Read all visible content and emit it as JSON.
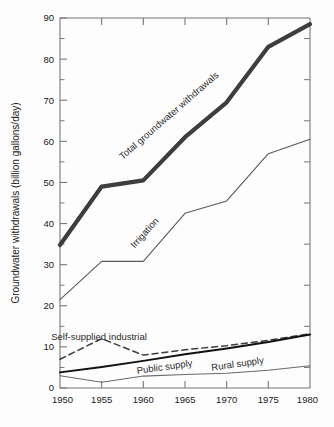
{
  "chart_data": {
    "type": "line",
    "title": "",
    "xlabel": "",
    "ylabel": "Groundwater withdrawals (billion gallons/day)",
    "x": [
      1950,
      1955,
      1960,
      1965,
      1970,
      1975,
      1980
    ],
    "xlim": [
      1950,
      1980
    ],
    "ylim": [
      0,
      90
    ],
    "xticks": [
      "1950",
      "1955",
      "1960",
      "1965",
      "1970",
      "1975",
      "1980"
    ],
    "yticks": [
      "0",
      "10",
      "20",
      "30",
      "40",
      "50",
      "60",
      "70",
      "80",
      "90"
    ],
    "ytick_minor_step": 5,
    "grid": false,
    "legend_position": "inline-labels",
    "series": [
      {
        "name": "Total groundwater withdrawals",
        "style": "thick-solid",
        "color": "#3d3d3d",
        "width": 4.2,
        "label_angle": -41,
        "label_x": 171,
        "label_y": 118,
        "values": [
          34.8,
          49.0,
          50.5,
          61.0,
          69.5,
          83.0,
          88.5
        ]
      },
      {
        "name": "Irrigation",
        "style": "thin-solid",
        "color": "#5a5a5a",
        "width": 1.1,
        "label_angle": -48,
        "label_x": 147,
        "label_y": 235,
        "values": [
          21.5,
          30.8,
          30.8,
          42.5,
          45.5,
          57.0,
          60.5
        ]
      },
      {
        "name": "Self-supplied industrial",
        "style": "dashed",
        "color": "#3d3d3d",
        "width": 1.5,
        "label_angle": 0,
        "label_x": 99,
        "label_y": 340,
        "values": [
          7.0,
          12.0,
          8.0,
          9.3,
          10.3,
          11.6,
          13.2
        ]
      },
      {
        "name": "Public supply",
        "style": "medium-solid",
        "color": "#111111",
        "width": 2.0,
        "label_angle": -8,
        "label_x": 165,
        "label_y": 370,
        "values": [
          3.8,
          5.1,
          6.6,
          8.2,
          9.6,
          11.2,
          13.0
        ]
      },
      {
        "name": "Rural supply",
        "style": "thin-solid",
        "color": "#6a6a6a",
        "width": 1.1,
        "label_angle": -8,
        "label_x": 238,
        "label_y": 367,
        "values": [
          3.0,
          1.4,
          2.9,
          3.3,
          3.6,
          4.3,
          5.4
        ]
      }
    ]
  }
}
